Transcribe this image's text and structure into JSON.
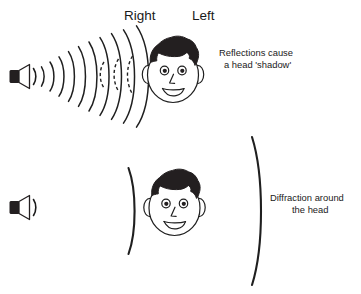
{
  "figure": {
    "background_color": "#ffffff",
    "ink_color": "#1f1f1f",
    "hair_color": "#231f20"
  },
  "labels": {
    "right": "Right",
    "left": "Left"
  },
  "captions": {
    "top": {
      "line1": "Reflections cause",
      "line2": "a head 'shadow'"
    },
    "bottom": {
      "line1": "Diffraction around",
      "line2": "the head"
    }
  },
  "panels": [
    {
      "id": "reflection-panel",
      "caption": "Reflections cause a head 'shadow'",
      "sound_source": "loudspeaker-icon",
      "incident_wavefronts": 10,
      "reflected_wavefronts": 3,
      "reflected_style": "dashed",
      "listener": "cartoon-head-face-front"
    },
    {
      "id": "diffraction-panel",
      "caption": "Diffraction around the head",
      "sound_source": "loudspeaker-icon",
      "incident_wavefronts": 1,
      "wavefront_arcs": 2,
      "listener": "cartoon-head-face-front"
    }
  ]
}
